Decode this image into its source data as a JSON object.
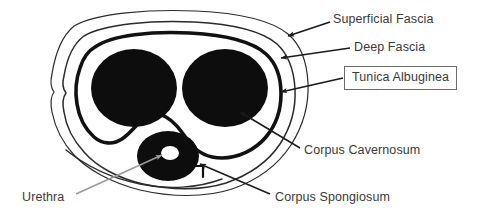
{
  "figure": {
    "background_color": "#ffffff",
    "ink_color": "#111111",
    "text_color": "#3a3a3a",
    "box_border_color": "#6b6b6b",
    "pointer_color": "#1a1a1a",
    "urethra_pointer_color": "#9a9a9a"
  },
  "labels": {
    "superficial_fascia": "Superficial Fascia",
    "deep_fascia": "Deep Fascia",
    "tunica_albuginea": "Tunica Albuginea",
    "corpus_cavernosum": "Corpus Cavernosum",
    "corpus_spongiosum": "Corpus Spongiosum",
    "urethra": "Urethra"
  },
  "structures": [
    {
      "name": "superficial-fascia",
      "label": "Superficial Fascia",
      "kind": "outer-contour",
      "fill": "none",
      "stroke": "#2b2b2b"
    },
    {
      "name": "deep-fascia",
      "label": "Deep Fascia",
      "kind": "contour",
      "fill": "none",
      "stroke": "#2b2b2b"
    },
    {
      "name": "tunica-albuginea",
      "label": "Tunica Albuginea",
      "kind": "thick-contour",
      "fill": "none",
      "stroke": "#111111"
    },
    {
      "name": "corpus-cavernosum-left",
      "label": "Corpus Cavernosum",
      "kind": "filled-ellipse",
      "fill": "#0d0d0d"
    },
    {
      "name": "corpus-cavernosum-right",
      "label": "Corpus Cavernosum",
      "kind": "filled-ellipse",
      "fill": "#0d0d0d"
    },
    {
      "name": "corpus-spongiosum",
      "label": "Corpus Spongiosum",
      "kind": "filled-ellipse",
      "fill": "#0d0d0d"
    },
    {
      "name": "urethra",
      "label": "Urethra",
      "kind": "lumen",
      "fill": "#ffffff"
    }
  ],
  "pointers": [
    {
      "name": "pointer-superficial-fascia",
      "from_label": "Superficial Fascia",
      "to_structure": "superficial-fascia"
    },
    {
      "name": "pointer-deep-fascia",
      "from_label": "Deep Fascia",
      "to_structure": "deep-fascia"
    },
    {
      "name": "pointer-tunica-albuginea",
      "from_label": "Tunica Albuginea",
      "to_structure": "tunica-albuginea"
    },
    {
      "name": "pointer-corpus-cavernosum",
      "from_label": "Corpus Cavernosum",
      "to_structure": "corpus-cavernosum-right"
    },
    {
      "name": "pointer-corpus-spongiosum",
      "from_label": "Corpus Spongiosum",
      "to_structure": "corpus-spongiosum"
    },
    {
      "name": "pointer-urethra",
      "from_label": "Urethra",
      "to_structure": "urethra"
    }
  ]
}
